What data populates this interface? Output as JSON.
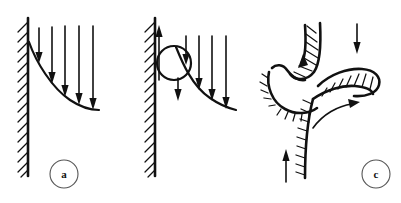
{
  "figure": {
    "background_color": "#ffffff",
    "ink_color": "#111111",
    "width": 401,
    "height": 203,
    "panels": [
      {
        "id": "a",
        "label": "a",
        "label_visible": true,
        "description": "Attached boundary layer velocity profile along a hatched vertical wall with downward flow arrows",
        "wall": {
          "orientation": "vertical",
          "hatching": "diagonal",
          "side": "left"
        },
        "arrow_count": 5,
        "arrow_direction": "down",
        "eddy": false
      },
      {
        "id": "b",
        "label": "",
        "label_visible": false,
        "description": "Incipient separation with reversed upward flow at the wall and a recirculation eddy",
        "wall": {
          "orientation": "vertical",
          "hatching": "diagonal",
          "side": "left"
        },
        "arrow_count": 4,
        "arrow_direction": "down",
        "eddy": true,
        "wall_arrow_direction": "up"
      },
      {
        "id": "c",
        "label": "c",
        "label_visible": true,
        "description": "Fully separated flow: hatched lobes with a hooked upper boundary, a tongue-shaped lobe and curved shear arrow",
        "wall": {
          "orientation": "curved",
          "hatching": "diagonal",
          "side": "inner"
        },
        "arrow_count": 2,
        "arrow_direction": "mixed",
        "eddy": false,
        "curved_arrow": true
      }
    ]
  },
  "labels": {
    "panel_a": "a",
    "panel_c": "c"
  },
  "icons": {
    "down_arrow": "down-arrow-icon",
    "up_arrow": "up-arrow-icon",
    "curved_arrow": "curved-arrow-icon",
    "eddy": "recirculation-circle-icon"
  }
}
